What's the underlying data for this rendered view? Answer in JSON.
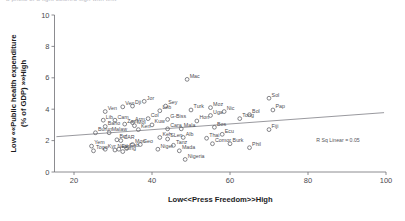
{
  "top_clipped_text": "a photo of a light colored sign with text",
  "chart_data": {
    "type": "scatter",
    "title": "",
    "xlabel": "Low<<Press Freedom>>High",
    "ylabel": "Low <<Public health expenditure (% of GDP) >>High",
    "xlim": [
      15,
      100
    ],
    "ylim": [
      0,
      10
    ],
    "xticks": [
      20,
      40,
      60,
      80,
      100
    ],
    "yticks": [
      0,
      2,
      4,
      6,
      8,
      10
    ],
    "grid": false,
    "legend": false,
    "annotation": "R Sq Linear = 0.05",
    "fit_line": {
      "type": "linear",
      "x_start": 15.5,
      "y_start": 2.25,
      "x_end": 99.5,
      "y_end": 3.78
    },
    "points": [
      {
        "label": "Yem",
        "x": 24.5,
        "y": 1.65
      },
      {
        "label": "Burun",
        "x": 25.5,
        "y": 2.5
      },
      {
        "label": "Togo",
        "x": 25.0,
        "y": 1.35
      },
      {
        "label": "Lib",
        "x": 27.5,
        "y": 3.3
      },
      {
        "label": "Ven",
        "x": 28.0,
        "y": 3.85
      },
      {
        "label": "Baho",
        "x": 28.0,
        "y": 2.9
      },
      {
        "label": "Malaw",
        "x": 29.0,
        "y": 2.5
      },
      {
        "label": "Kyr",
        "x": 28.0,
        "y": 1.45
      },
      {
        "label": "Nep",
        "x": 30.5,
        "y": 1.4
      },
      {
        "label": "Cam",
        "x": 30.5,
        "y": 3.3
      },
      {
        "label": "Bul",
        "x": 31.0,
        "y": 2.05
      },
      {
        "label": "Ethi",
        "x": 31.5,
        "y": 1.45
      },
      {
        "label": "CAR",
        "x": 32.0,
        "y": 2.0
      },
      {
        "label": "Sing",
        "x": 32.5,
        "y": 1.3
      },
      {
        "label": "Zam",
        "x": 33.0,
        "y": 3.05
      },
      {
        "label": "Ven2",
        "x": 32.5,
        "y": 4.15
      },
      {
        "label": "Gab",
        "x": 33.5,
        "y": 1.5
      },
      {
        "label": "Arm",
        "x": 35.0,
        "y": 3.15
      },
      {
        "label": "Dji",
        "x": 35.0,
        "y": 4.2
      },
      {
        "label": "Mol",
        "x": 35.5,
        "y": 2.95
      },
      {
        "label": "Mon",
        "x": 35.0,
        "y": 1.75
      },
      {
        "label": "Ken",
        "x": 36.5,
        "y": 2.7
      },
      {
        "label": "Geo",
        "x": 37.0,
        "y": 1.75
      },
      {
        "label": "Col",
        "x": 39.0,
        "y": 3.4
      },
      {
        "label": "Jor",
        "x": 38.0,
        "y": 4.5
      },
      {
        "label": "Kuw",
        "x": 40.0,
        "y": 3.0
      },
      {
        "label": "Niger",
        "x": 41.5,
        "y": 1.45
      },
      {
        "label": "Leb",
        "x": 42.0,
        "y": 3.9
      },
      {
        "label": "Keh",
        "x": 42.0,
        "y": 2.2
      },
      {
        "label": "Sey",
        "x": 43.5,
        "y": 4.2
      },
      {
        "label": "G-Biss",
        "x": 44.0,
        "y": 3.35
      },
      {
        "label": "SLen",
        "x": 44.0,
        "y": 2.1
      },
      {
        "label": "Cara",
        "x": 44.0,
        "y": 2.75
      },
      {
        "label": "Tanz",
        "x": 45.5,
        "y": 1.7
      },
      {
        "label": "Mala",
        "x": 47.5,
        "y": 2.75
      },
      {
        "label": "Alb",
        "x": 48.0,
        "y": 2.2
      },
      {
        "label": "Mada",
        "x": 47.0,
        "y": 1.35
      },
      {
        "label": "Nigeria",
        "x": 48.5,
        "y": 0.8
      },
      {
        "label": "Mac",
        "x": 49.0,
        "y": 5.9
      },
      {
        "label": "Turk",
        "x": 50.0,
        "y": 3.95
      },
      {
        "label": "Hon",
        "x": 51.5,
        "y": 3.25
      },
      {
        "label": "Thai",
        "x": 54.0,
        "y": 2.15
      },
      {
        "label": "Comor",
        "x": 55.5,
        "y": 1.8
      },
      {
        "label": "Uga",
        "x": 55.0,
        "y": 3.6
      },
      {
        "label": "Moz",
        "x": 55.0,
        "y": 4.1
      },
      {
        "label": "Bos",
        "x": 56.0,
        "y": 2.85
      },
      {
        "label": "Nic",
        "x": 58.5,
        "y": 3.85
      },
      {
        "label": "Ecu",
        "x": 58.0,
        "y": 2.4
      },
      {
        "label": "Burk",
        "x": 60.0,
        "y": 1.8
      },
      {
        "label": "Tong",
        "x": 62.5,
        "y": 3.4
      },
      {
        "label": "Bol",
        "x": 65.0,
        "y": 3.65
      },
      {
        "label": "Phil",
        "x": 65.0,
        "y": 1.55
      },
      {
        "label": "Sol",
        "x": 70.0,
        "y": 4.7
      },
      {
        "label": "Pap",
        "x": 71.0,
        "y": 3.95
      },
      {
        "label": "Fiji",
        "x": 70.0,
        "y": 2.7
      }
    ]
  }
}
